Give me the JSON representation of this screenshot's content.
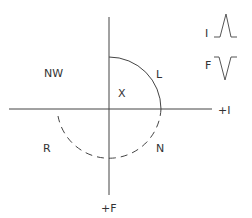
{
  "diagram": {
    "quadrant_labels": {
      "nw": "NW",
      "x": "X",
      "l": "L",
      "r": "R",
      "n": "N"
    },
    "axis_labels": {
      "plus_i": "+I",
      "plus_f": "+F"
    },
    "legend": {
      "i_label": "I",
      "f_label": "F",
      "i_wave": "upward-spike",
      "f_wave": "downward-spike"
    },
    "colors": {
      "line": "#444444",
      "text": "#333333",
      "background": "#ffffff"
    }
  }
}
